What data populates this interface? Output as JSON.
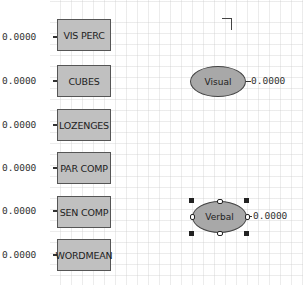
{
  "diagram": {
    "observed": [
      {
        "name": "VIS PERC",
        "value": "0.0000"
      },
      {
        "name": "CUBES",
        "value": "0.0000"
      },
      {
        "name": "LOZENGES",
        "value": "0.0000"
      },
      {
        "name": "PAR COMP",
        "value": "0.0000"
      },
      {
        "name": "SEN COMP",
        "value": "0.0000"
      },
      {
        "name": "WORDMEAN",
        "value": "0.0000"
      }
    ],
    "latent": [
      {
        "name": "Visual",
        "value": "0.0000",
        "selected": false
      },
      {
        "name": "Verbal",
        "value": "0.0000",
        "selected": true
      }
    ]
  },
  "colors": {
    "box_fill": "#c0c0c0",
    "ellipse_fill": "#a8a8a8",
    "background": "#ffffff"
  }
}
